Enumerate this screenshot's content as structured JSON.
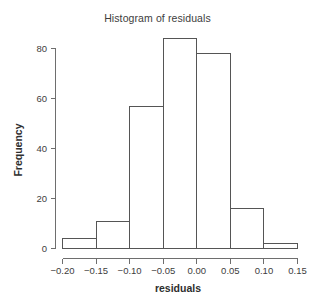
{
  "chart_data": {
    "type": "bar",
    "title": "Histogram of residuals",
    "xlabel": "residuals",
    "ylabel": "Frequency",
    "grid": false,
    "legend": "none",
    "bin_width": 0.05,
    "bin_edges": [
      -0.2,
      -0.15,
      -0.1,
      -0.05,
      0.0,
      0.05,
      0.1,
      0.15
    ],
    "categories": [
      "-0.20 to -0.15",
      "-0.15 to -0.10",
      "-0.10 to -0.05",
      "-0.05 to 0.00",
      "0.00 to 0.05",
      "0.05 to 0.10",
      "0.10 to 0.15"
    ],
    "values": [
      4,
      11,
      57,
      84,
      78,
      16,
      2
    ],
    "xlim": [
      -0.2,
      0.15
    ],
    "ylim": [
      0,
      84
    ],
    "xticks": [
      -0.2,
      -0.15,
      -0.1,
      -0.05,
      0.0,
      0.05,
      0.1,
      0.15
    ],
    "xtick_labels": [
      "−0.20",
      "−0.15",
      "−0.10",
      "−0.05",
      "0.00",
      "0.05",
      "0.10",
      "0.15"
    ],
    "yticks": [
      0,
      20,
      40,
      60,
      80
    ],
    "ytick_labels": [
      "0",
      "20",
      "40",
      "60",
      "80"
    ],
    "colors": {
      "bar_fill": "#ffffff",
      "bar_stroke": "#555555",
      "axis": "#6e6e6e",
      "text": "#3d3d3d",
      "background": "#ffffff"
    }
  }
}
